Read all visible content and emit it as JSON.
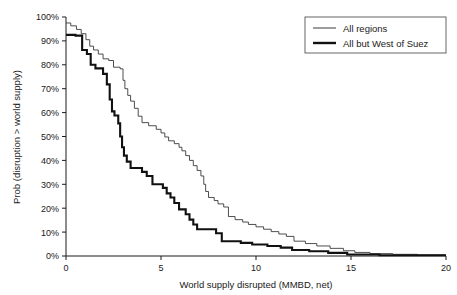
{
  "chart_data": {
    "type": "line",
    "subtype": "step-exceedance-curve",
    "title": "",
    "xlabel": "World supply disrupted (MMBD, net)",
    "ylabel": "Prob (disruption > world supply)",
    "xlim": [
      0,
      20
    ],
    "ylim": [
      0,
      1.0
    ],
    "xticks": [
      0,
      5,
      10,
      15,
      20
    ],
    "xtick_labels": [
      "0",
      "5",
      "10",
      "15",
      "20"
    ],
    "yticks": [
      0,
      0.1,
      0.2,
      0.3,
      0.4,
      0.5,
      0.6,
      0.7,
      0.8,
      0.9,
      1.0
    ],
    "ytick_labels": [
      "0%",
      "10%",
      "20%",
      "30%",
      "40%",
      "50%",
      "60%",
      "70%",
      "80%",
      "90%",
      "100%"
    ],
    "grid": false,
    "legend_position": "top-right",
    "series": [
      {
        "name": "All regions",
        "line_style": "thin",
        "line_width": 0.9,
        "color": "#3a3a3a",
        "points": [
          [
            0.0,
            0.975
          ],
          [
            0.25,
            0.975
          ],
          [
            0.25,
            0.963
          ],
          [
            0.55,
            0.963
          ],
          [
            0.55,
            0.948
          ],
          [
            0.8,
            0.948
          ],
          [
            0.8,
            0.93
          ],
          [
            1.05,
            0.93
          ],
          [
            1.05,
            0.905
          ],
          [
            1.25,
            0.905
          ],
          [
            1.25,
            0.878
          ],
          [
            1.45,
            0.878
          ],
          [
            1.45,
            0.862
          ],
          [
            1.7,
            0.862
          ],
          [
            1.7,
            0.845
          ],
          [
            1.95,
            0.845
          ],
          [
            1.95,
            0.825
          ],
          [
            2.25,
            0.825
          ],
          [
            2.25,
            0.818
          ],
          [
            2.5,
            0.818
          ],
          [
            2.5,
            0.79
          ],
          [
            2.85,
            0.79
          ],
          [
            2.85,
            0.783
          ],
          [
            3.0,
            0.783
          ],
          [
            3.0,
            0.735
          ],
          [
            3.1,
            0.735
          ],
          [
            3.1,
            0.7
          ],
          [
            3.25,
            0.7
          ],
          [
            3.25,
            0.672
          ],
          [
            3.4,
            0.672
          ],
          [
            3.4,
            0.648
          ],
          [
            3.6,
            0.648
          ],
          [
            3.6,
            0.618
          ],
          [
            3.8,
            0.618
          ],
          [
            3.8,
            0.585
          ],
          [
            4.0,
            0.585
          ],
          [
            4.0,
            0.558
          ],
          [
            4.35,
            0.558
          ],
          [
            4.35,
            0.545
          ],
          [
            4.75,
            0.545
          ],
          [
            4.75,
            0.53
          ],
          [
            5.0,
            0.53
          ],
          [
            5.0,
            0.515
          ],
          [
            5.2,
            0.515
          ],
          [
            5.2,
            0.498
          ],
          [
            5.4,
            0.498
          ],
          [
            5.4,
            0.482
          ],
          [
            5.7,
            0.482
          ],
          [
            5.7,
            0.47
          ],
          [
            5.95,
            0.47
          ],
          [
            5.95,
            0.455
          ],
          [
            6.1,
            0.455
          ],
          [
            6.1,
            0.44
          ],
          [
            6.3,
            0.44
          ],
          [
            6.3,
            0.42
          ],
          [
            6.5,
            0.42
          ],
          [
            6.5,
            0.4
          ],
          [
            6.7,
            0.4
          ],
          [
            6.7,
            0.378
          ],
          [
            6.9,
            0.378
          ],
          [
            6.9,
            0.358
          ],
          [
            7.1,
            0.358
          ],
          [
            7.1,
            0.335
          ],
          [
            7.25,
            0.335
          ],
          [
            7.25,
            0.3
          ],
          [
            7.35,
            0.3
          ],
          [
            7.35,
            0.27
          ],
          [
            7.5,
            0.27
          ],
          [
            7.5,
            0.245
          ],
          [
            7.8,
            0.245
          ],
          [
            7.8,
            0.232
          ],
          [
            8.0,
            0.232
          ],
          [
            8.0,
            0.218
          ],
          [
            8.3,
            0.218
          ],
          [
            8.3,
            0.205
          ],
          [
            8.55,
            0.205
          ],
          [
            8.55,
            0.165
          ],
          [
            8.9,
            0.165
          ],
          [
            8.9,
            0.152
          ],
          [
            9.3,
            0.152
          ],
          [
            9.3,
            0.142
          ],
          [
            9.6,
            0.142
          ],
          [
            9.6,
            0.132
          ],
          [
            10.0,
            0.132
          ],
          [
            10.0,
            0.122
          ],
          [
            10.4,
            0.122
          ],
          [
            10.4,
            0.112
          ],
          [
            10.8,
            0.112
          ],
          [
            10.8,
            0.102
          ],
          [
            11.2,
            0.102
          ],
          [
            11.2,
            0.092
          ],
          [
            11.6,
            0.092
          ],
          [
            11.6,
            0.082
          ],
          [
            12.0,
            0.082
          ],
          [
            12.0,
            0.062
          ],
          [
            12.6,
            0.062
          ],
          [
            12.6,
            0.052
          ],
          [
            13.2,
            0.052
          ],
          [
            13.2,
            0.042
          ],
          [
            13.9,
            0.042
          ],
          [
            13.9,
            0.032
          ],
          [
            14.6,
            0.032
          ],
          [
            14.6,
            0.022
          ],
          [
            15.2,
            0.022
          ],
          [
            15.2,
            0.015
          ],
          [
            16.0,
            0.015
          ],
          [
            16.0,
            0.01
          ],
          [
            17.2,
            0.01
          ],
          [
            17.2,
            0.007
          ],
          [
            18.5,
            0.007
          ],
          [
            18.5,
            0.004
          ],
          [
            20.0,
            0.004
          ]
        ]
      },
      {
        "name": "All but West of Suez",
        "line_style": "thick",
        "line_width": 2.1,
        "color": "#111111",
        "points": [
          [
            0.0,
            0.925
          ],
          [
            0.5,
            0.925
          ],
          [
            0.5,
            0.922
          ],
          [
            0.85,
            0.922
          ],
          [
            0.85,
            0.862
          ],
          [
            1.1,
            0.862
          ],
          [
            1.1,
            0.845
          ],
          [
            1.3,
            0.845
          ],
          [
            1.3,
            0.8
          ],
          [
            1.55,
            0.8
          ],
          [
            1.55,
            0.785
          ],
          [
            1.95,
            0.785
          ],
          [
            1.95,
            0.762
          ],
          [
            2.15,
            0.762
          ],
          [
            2.15,
            0.718
          ],
          [
            2.3,
            0.718
          ],
          [
            2.3,
            0.655
          ],
          [
            2.42,
            0.655
          ],
          [
            2.42,
            0.605
          ],
          [
            2.55,
            0.605
          ],
          [
            2.55,
            0.588
          ],
          [
            2.75,
            0.588
          ],
          [
            2.75,
            0.555
          ],
          [
            2.85,
            0.555
          ],
          [
            2.85,
            0.5
          ],
          [
            2.95,
            0.5
          ],
          [
            2.95,
            0.455
          ],
          [
            3.05,
            0.455
          ],
          [
            3.05,
            0.42
          ],
          [
            3.2,
            0.42
          ],
          [
            3.2,
            0.395
          ],
          [
            3.4,
            0.395
          ],
          [
            3.4,
            0.368
          ],
          [
            4.0,
            0.368
          ],
          [
            4.0,
            0.352
          ],
          [
            4.25,
            0.352
          ],
          [
            4.25,
            0.335
          ],
          [
            4.55,
            0.335
          ],
          [
            4.55,
            0.3
          ],
          [
            5.1,
            0.3
          ],
          [
            5.1,
            0.285
          ],
          [
            5.3,
            0.285
          ],
          [
            5.3,
            0.262
          ],
          [
            5.5,
            0.262
          ],
          [
            5.5,
            0.245
          ],
          [
            5.7,
            0.245
          ],
          [
            5.7,
            0.222
          ],
          [
            5.95,
            0.222
          ],
          [
            5.95,
            0.195
          ],
          [
            6.3,
            0.195
          ],
          [
            6.3,
            0.175
          ],
          [
            6.5,
            0.175
          ],
          [
            6.5,
            0.152
          ],
          [
            6.7,
            0.152
          ],
          [
            6.7,
            0.132
          ],
          [
            6.9,
            0.132
          ],
          [
            6.9,
            0.112
          ],
          [
            7.9,
            0.112
          ],
          [
            7.9,
            0.095
          ],
          [
            8.2,
            0.095
          ],
          [
            8.2,
            0.062
          ],
          [
            9.2,
            0.062
          ],
          [
            9.2,
            0.055
          ],
          [
            9.8,
            0.055
          ],
          [
            9.8,
            0.048
          ],
          [
            10.6,
            0.048
          ],
          [
            10.6,
            0.042
          ],
          [
            11.3,
            0.042
          ],
          [
            11.3,
            0.035
          ],
          [
            11.9,
            0.035
          ],
          [
            11.9,
            0.025
          ],
          [
            12.8,
            0.025
          ],
          [
            12.8,
            0.02
          ],
          [
            13.8,
            0.02
          ],
          [
            13.8,
            0.013
          ],
          [
            14.8,
            0.013
          ],
          [
            14.8,
            0.006
          ],
          [
            16.5,
            0.006
          ],
          [
            16.5,
            0.003
          ],
          [
            20.0,
            0.003
          ]
        ]
      }
    ]
  },
  "legend": {
    "entries": [
      {
        "label": "All regions",
        "swatch": "thin-line-swatch"
      },
      {
        "label": "All but West of Suez",
        "swatch": "thick-line-swatch"
      }
    ]
  },
  "colors": {
    "axis": "#1a1a1a",
    "series_thin": "#3a3a3a",
    "series_thick": "#111111",
    "legend_border": "#555555",
    "background": "#ffffff"
  }
}
